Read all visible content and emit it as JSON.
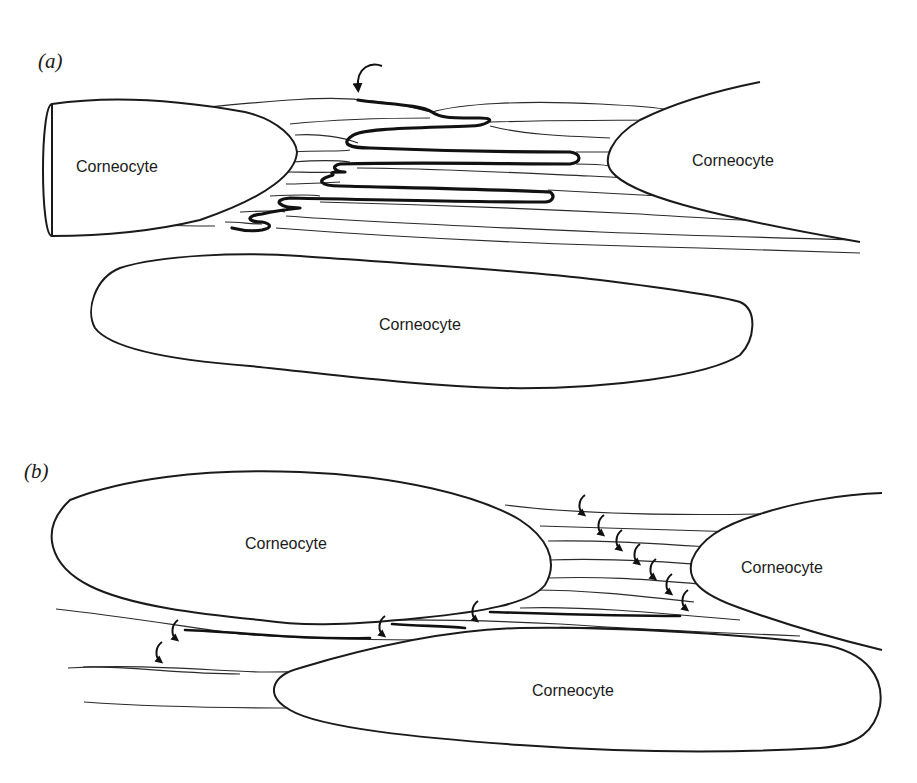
{
  "figure": {
    "panel_a": {
      "label": "(a)",
      "cells": [
        {
          "name": "left",
          "label": "Corneocyte"
        },
        {
          "name": "right",
          "label": "Corneocyte"
        },
        {
          "name": "bottom",
          "label": "Corneocyte"
        }
      ],
      "annotation": "single curved arrow indicating a continuous folded (thick) lipid pathway through the intercellular lamellae"
    },
    "panel_b": {
      "label": "(b)",
      "cells": [
        {
          "name": "top-left",
          "label": "Corneocyte"
        },
        {
          "name": "right",
          "label": "Corneocyte"
        },
        {
          "name": "bottom",
          "label": "Corneocyte"
        }
      ],
      "arrow_count": 11,
      "annotation": "many small curved arrows indicating stepwise crossing between parallel lamellae"
    },
    "colors": {
      "background": "#ffffff",
      "ink": "#1a1a1a"
    }
  }
}
